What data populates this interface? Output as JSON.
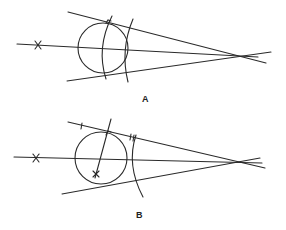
{
  "figures": [
    {
      "id": "A",
      "label": "A",
      "label_pos": [
        142,
        94
      ],
      "elements": {
        "axis_line": [
          17,
          44,
          258,
          57
        ],
        "upper_tangent": [
          68,
          12,
          266,
          63
        ],
        "lower_tangent": [
          67,
          81,
          271,
          52
        ],
        "point_mark": [
          38,
          45
        ],
        "circle": {
          "cx": 103,
          "cy": 48,
          "r": 25
        },
        "arc1": "M112,16 Q96,48 106,79",
        "arc2": "M133,19 Q120,50 128,82"
      }
    },
    {
      "id": "B",
      "label": "B",
      "label_pos": [
        136,
        210
      ],
      "elements": {
        "axis_line": [
          14,
          157,
          262,
          163
        ],
        "upper_tangent": [
          68,
          122,
          265,
          168
        ],
        "lower_tangent": [
          62,
          194,
          260,
          158
        ],
        "point_mark": [
          36,
          158
        ],
        "center_mark": [
          96,
          174
        ],
        "circle": {
          "cx": 101,
          "cy": 158,
          "r": 26
        },
        "perpendicular": [
          111,
          119,
          95,
          178
        ],
        "arc": "M136,135 Q126,165 143,197"
      }
    }
  ]
}
